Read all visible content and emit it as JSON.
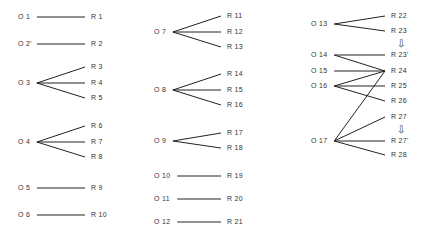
{
  "diagram": {
    "type": "stimulus-response mapping",
    "nodes_left": [
      {
        "id": "O1",
        "label": "O 1",
        "x": 18,
        "y": 17
      },
      {
        "id": "O2",
        "label": "O 2'",
        "x": 18,
        "y": 44
      },
      {
        "id": "O3",
        "label": "O 3",
        "x": 18,
        "y": 83
      },
      {
        "id": "O4",
        "label": "O 4",
        "x": 18,
        "y": 142
      },
      {
        "id": "O5",
        "label": "O 5",
        "x": 18,
        "y": 188
      },
      {
        "id": "O6",
        "label": "O 6",
        "x": 18,
        "y": 215
      },
      {
        "id": "O7",
        "label": "O 7",
        "x": 154,
        "y": 32
      },
      {
        "id": "O8",
        "label": "O 8",
        "x": 154,
        "y": 90
      },
      {
        "id": "O9",
        "label": "O 9",
        "x": 154,
        "y": 141
      },
      {
        "id": "O10",
        "label": "O 10",
        "x": 154,
        "y": 176
      },
      {
        "id": "O11",
        "label": "O 11",
        "x": 154,
        "y": 199
      },
      {
        "id": "O12",
        "label": "O 12",
        "x": 154,
        "y": 222
      },
      {
        "id": "O13",
        "label": "O 13",
        "x": 311,
        "y": 24
      },
      {
        "id": "O14",
        "label": "O 14",
        "x": 311,
        "y": 55
      },
      {
        "id": "O15",
        "label": "O 15",
        "x": 311,
        "y": 71
      },
      {
        "id": "O16",
        "label": "O 16",
        "x": 311,
        "y": 86
      },
      {
        "id": "O17",
        "label": "O 17",
        "x": 311,
        "y": 141
      }
    ],
    "nodes_right": [
      {
        "id": "R1",
        "label": "R 1",
        "x": 91,
        "y": 17
      },
      {
        "id": "R2",
        "label": "R 2",
        "x": 91,
        "y": 44
      },
      {
        "id": "R3",
        "label": "R 3",
        "x": 91,
        "y": 67
      },
      {
        "id": "R4",
        "label": "R 4",
        "x": 91,
        "y": 83
      },
      {
        "id": "R5",
        "label": "R 5",
        "x": 91,
        "y": 98
      },
      {
        "id": "R6",
        "label": "R 6",
        "x": 91,
        "y": 126
      },
      {
        "id": "R7",
        "label": "R 7",
        "x": 91,
        "y": 142
      },
      {
        "id": "R8",
        "label": "R 8",
        "x": 91,
        "y": 157
      },
      {
        "id": "R9",
        "label": "R 9",
        "x": 91,
        "y": 188
      },
      {
        "id": "R10",
        "label": "R 10",
        "x": 91,
        "y": 215
      },
      {
        "id": "R11",
        "label": "R 11",
        "x": 227,
        "y": 16
      },
      {
        "id": "R12",
        "label": "R 12",
        "x": 227,
        "y": 32
      },
      {
        "id": "R13",
        "label": "R 13",
        "x": 227,
        "y": 47
      },
      {
        "id": "R14",
        "label": "R 14",
        "x": 227,
        "y": 74
      },
      {
        "id": "R15",
        "label": "R 15",
        "x": 227,
        "y": 90
      },
      {
        "id": "R16",
        "label": "R 16",
        "x": 227,
        "y": 105
      },
      {
        "id": "R17",
        "label": "R 17",
        "x": 227,
        "y": 133
      },
      {
        "id": "R18",
        "label": "R 18",
        "x": 227,
        "y": 148
      },
      {
        "id": "R19",
        "label": "R 19",
        "x": 227,
        "y": 176
      },
      {
        "id": "R20",
        "label": "R 20",
        "x": 227,
        "y": 199
      },
      {
        "id": "R21",
        "label": "R 21",
        "x": 227,
        "y": 222
      },
      {
        "id": "R22",
        "label": "R 22",
        "x": 391,
        "y": 16
      },
      {
        "id": "R23",
        "label": "R 23",
        "x": 391,
        "y": 31
      },
      {
        "id": "R23p",
        "label": "R 23'",
        "x": 391,
        "y": 55
      },
      {
        "id": "R24",
        "label": "R 24",
        "x": 391,
        "y": 71
      },
      {
        "id": "R25",
        "label": "R 25",
        "x": 391,
        "y": 86
      },
      {
        "id": "R26",
        "label": "R 26",
        "x": 391,
        "y": 101
      },
      {
        "id": "R27",
        "label": "R 27",
        "x": 391,
        "y": 117
      },
      {
        "id": "R27p",
        "label": "R 27'",
        "x": 391,
        "y": 141
      },
      {
        "id": "R28",
        "label": "R 28",
        "x": 391,
        "y": 155
      }
    ],
    "edges": [
      [
        "O1",
        "R1"
      ],
      [
        "O2",
        "R2"
      ],
      [
        "O3",
        "R3"
      ],
      [
        "O3",
        "R4"
      ],
      [
        "O3",
        "R5"
      ],
      [
        "O4",
        "R6"
      ],
      [
        "O4",
        "R7"
      ],
      [
        "O4",
        "R8"
      ],
      [
        "O5",
        "R9"
      ],
      [
        "O6",
        "R10"
      ],
      [
        "O7",
        "R11"
      ],
      [
        "O7",
        "R12"
      ],
      [
        "O7",
        "R13"
      ],
      [
        "O8",
        "R14"
      ],
      [
        "O8",
        "R15"
      ],
      [
        "O8",
        "R16"
      ],
      [
        "O9",
        "R17"
      ],
      [
        "O9",
        "R18"
      ],
      [
        "O10",
        "R19"
      ],
      [
        "O11",
        "R20"
      ],
      [
        "O12",
        "R21"
      ],
      [
        "O13",
        "R22"
      ],
      [
        "O13",
        "R23"
      ],
      [
        "O14",
        "R23p"
      ],
      [
        "O14",
        "R24"
      ],
      [
        "O15",
        "R24"
      ],
      [
        "O16",
        "R24"
      ],
      [
        "O16",
        "R25"
      ],
      [
        "O16",
        "R26"
      ],
      [
        "O17",
        "R24"
      ],
      [
        "O17",
        "R27"
      ],
      [
        "O17",
        "R27p"
      ],
      [
        "O17",
        "R28"
      ]
    ],
    "transform_arrows": [
      {
        "from": "R23",
        "to": "R23p",
        "glyph": "⇩",
        "x": 397,
        "y": 39
      },
      {
        "from": "R27",
        "to": "R27p",
        "glyph": "⇩",
        "x": 397,
        "y": 125
      }
    ],
    "line_color": "#222222",
    "text_color": "#333333"
  }
}
